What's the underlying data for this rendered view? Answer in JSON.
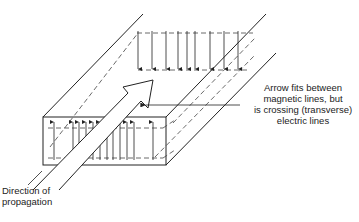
{
  "diagram": {
    "annotations": {
      "callout": {
        "line1": "Arrow fits between",
        "line2": "magnetic lines, but",
        "line3": "is crossing (transverse)",
        "line4": "electric lines"
      },
      "direction": {
        "line1": "Direction of",
        "line2": "propagation"
      }
    },
    "elements": {
      "waveguide": "rectangular waveguide (perspective)",
      "magnetic_field_lines": "dashed loops",
      "electric_field_lines": "transverse vertical arrows",
      "propagation_arrow": "large open arrow"
    },
    "colors": {
      "line": "#222222",
      "background": "#ffffff"
    }
  }
}
